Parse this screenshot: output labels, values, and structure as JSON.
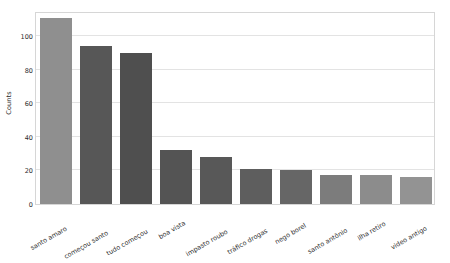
{
  "chart_data": {
    "type": "bar",
    "title": "",
    "xlabel": "",
    "ylabel": "Counts",
    "categories": [
      "santo amaro",
      "começou santo",
      "tudo começou",
      "boa vista",
      "impasto roubo",
      "tráfico drogas",
      "nego borel",
      "santo antônio",
      "ilha retiro",
      "video antigo"
    ],
    "values": [
      111,
      94,
      90,
      32,
      28,
      21,
      20,
      17,
      17,
      16
    ],
    "bar_colors": [
      "#8f8f8f",
      "#575757",
      "#4f4f4f",
      "#545454",
      "#585858",
      "#5e5e5e",
      "#666666",
      "#7c7c7c",
      "#8c8c8c",
      "#939393"
    ],
    "ylim": [
      0,
      115
    ],
    "yticks": [
      0,
      20,
      40,
      60,
      80,
      100
    ],
    "ytick_labels": [
      "0",
      "20",
      "40",
      "60",
      "80",
      "100"
    ],
    "grid": true,
    "grid_color": "#e3e3e3",
    "legend": null,
    "frame_color": "#d6d6d6",
    "background": "#ffffff"
  }
}
